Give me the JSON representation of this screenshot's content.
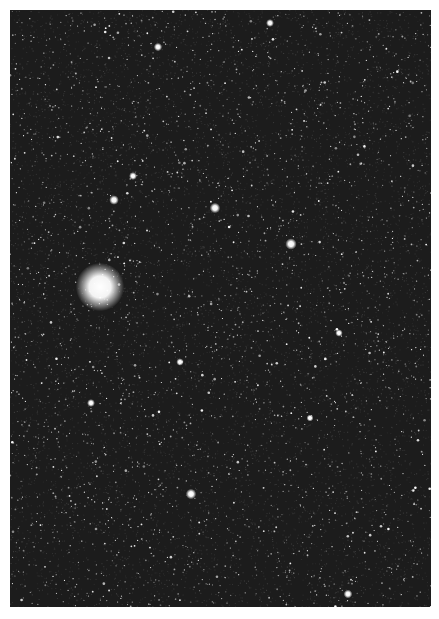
{
  "image": {
    "subject": "star field with bright globular cluster",
    "frame": {
      "left": 10,
      "top": 10,
      "width": 421,
      "height": 597
    },
    "background_color": "#1c1c1c",
    "page_color": "#ffffff",
    "star_color": "#ffffff",
    "bright_objects": [
      {
        "name": "globular-cluster",
        "x": 90,
        "y": 277,
        "r": 11
      },
      {
        "x": 281,
        "y": 234,
        "r": 2.6
      },
      {
        "x": 205,
        "y": 198,
        "r": 2.4
      },
      {
        "x": 104,
        "y": 190,
        "r": 2.2
      },
      {
        "x": 181,
        "y": 484,
        "r": 2.4
      },
      {
        "x": 123,
        "y": 166,
        "r": 1.8
      },
      {
        "x": 260,
        "y": 13,
        "r": 1.8
      },
      {
        "x": 148,
        "y": 37,
        "r": 1.9
      },
      {
        "x": 338,
        "y": 584,
        "r": 2.0
      },
      {
        "x": 81,
        "y": 393,
        "r": 1.8
      },
      {
        "x": 329,
        "y": 323,
        "r": 1.7
      },
      {
        "x": 170,
        "y": 352,
        "r": 1.7
      },
      {
        "x": 300,
        "y": 408,
        "r": 1.6
      }
    ],
    "faint_star_count": 2600
  }
}
